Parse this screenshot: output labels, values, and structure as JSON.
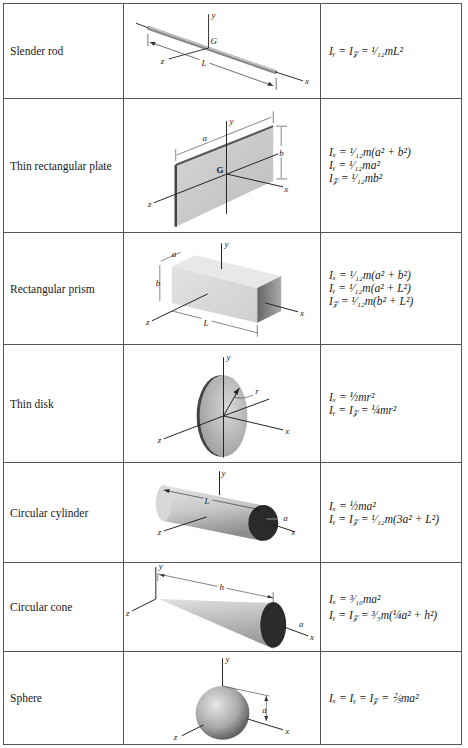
{
  "rows": [
    {
      "name": "Slender rod",
      "figure": "slender-rod",
      "labels": {
        "y": "y",
        "G": "G",
        "z": "z",
        "L": "L",
        "x": "x"
      },
      "formulas": [
        "I_y = I_z = (1/12)mL²"
      ],
      "display": [
        "Iᵧ = I𝓏 = ¹⁄₁₂mL²"
      ]
    },
    {
      "name": "Thin rectangular plate",
      "figure": "thin-rectangular-plate",
      "labels": {
        "a": "a",
        "y": "y",
        "b": "b",
        "G": "G",
        "x": "x",
        "z": "z"
      },
      "formulas": [
        "I_x = (1/12)m(a² + b²)",
        "I_y = (1/12)ma²",
        "I_z = (1/12)mb²"
      ],
      "display": [
        "Iₓ = ¹⁄₁₂m(a² + b²)",
        "Iᵧ = ¹⁄₁₂ma²",
        "I𝓏 = ¹⁄₁₂mb²"
      ]
    },
    {
      "name": "Rectangular prism",
      "figure": "rectangular-prism",
      "labels": {
        "a": "a",
        "y": "y",
        "b": "b",
        "z": "z",
        "L": "L",
        "x": "x"
      },
      "formulas": [
        "I_x = (1/12)m(a² + b²)",
        "I_y = (1/12)m(a² + L²)",
        "I_z = (1/12)m(b² + L²)"
      ],
      "display": [
        "Iₓ = ¹⁄₁₂m(a² + b²)",
        "Iᵧ = ¹⁄₁₂m(a² + L²)",
        "I𝓏 = ¹⁄₁₂m(b² + L²)"
      ]
    },
    {
      "name": "Thin disk",
      "figure": "thin-disk",
      "labels": {
        "y": "y",
        "r": "r",
        "z": "z",
        "x": "x"
      },
      "formulas": [
        "I_x = (1/2)mr²",
        "I_y = I_z = (1/4)mr²"
      ],
      "display": [
        "Iₓ = ½mr²",
        "Iᵧ = I𝓏 = ¼mr²"
      ]
    },
    {
      "name": "Circular cylinder",
      "figure": "circular-cylinder",
      "labels": {
        "y": "y",
        "L": "L",
        "a": "a",
        "z": "z",
        "x": "x"
      },
      "formulas": [
        "I_x = (1/2)ma²",
        "I_y = I_z = (1/12)m(3a² + L²)"
      ],
      "display": [
        "Iₓ = ½ma²",
        "Iᵧ = I𝓏 = ¹⁄₁₂m(3a² + L²)"
      ]
    },
    {
      "name": "Circular cone",
      "figure": "circular-cone",
      "labels": {
        "y": "y",
        "h": "h",
        "z": "z",
        "a": "a",
        "x": "x"
      },
      "formulas": [
        "I_x = (3/10)ma²",
        "I_y = I_z = (3/5)m((1/4)a² + h²)"
      ],
      "display": [
        "Iₓ = ³⁄₁₀ma²",
        "Iᵧ = I𝓏 = ³⁄₅m(¼a² + h²)"
      ]
    },
    {
      "name": "Sphere",
      "figure": "sphere",
      "labels": {
        "y": "y",
        "a": "a",
        "z": "z",
        "x": "x"
      },
      "formulas": [
        "I_x = I_y = I_z = (2/5)ma²"
      ],
      "display": [
        "Iₓ = Iᵧ = I𝓏 = ⅖ma²"
      ]
    }
  ]
}
